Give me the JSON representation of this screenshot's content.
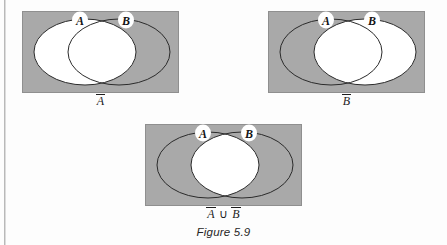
{
  "figure": {
    "caption": "Figure 5.9",
    "background": "#ffffff",
    "shade_color": "#a9a9a9",
    "outline_color": "#2b2b2b",
    "unshaded_color": "#ffffff"
  },
  "diagrams": [
    {
      "id": "a-complement",
      "label_parts": {
        "first": "A",
        "op": "",
        "second": ""
      },
      "label_text": "A̅",
      "set_a_letter": "A",
      "set_b_letter": "B",
      "shaded_description": "complement of A",
      "white_region": "ellipse-a"
    },
    {
      "id": "b-complement",
      "label_parts": {
        "first": "B",
        "op": "",
        "second": ""
      },
      "label_text": "B̅",
      "set_a_letter": "A",
      "set_b_letter": "B",
      "shaded_description": "complement of B",
      "white_region": "ellipse-b"
    },
    {
      "id": "a-complement-union-b-complement",
      "label_parts": {
        "first": "A",
        "op": "∪",
        "second": "B"
      },
      "label_text": "A̅ ∪ B̅",
      "set_a_letter": "A",
      "set_b_letter": "B",
      "shaded_description": "union of complement of A and complement of B",
      "white_region": "intersection"
    }
  ]
}
